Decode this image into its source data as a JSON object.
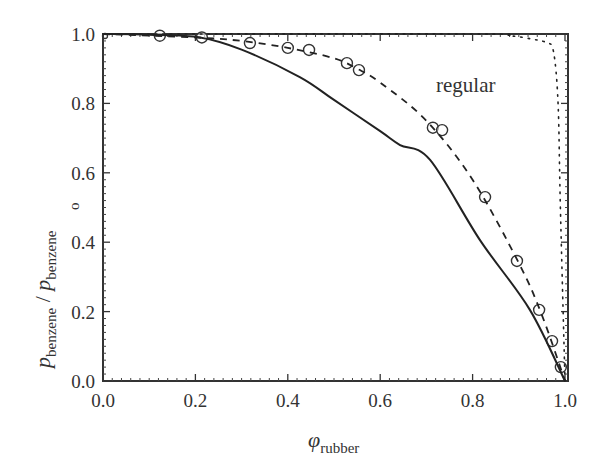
{
  "chart_data": {
    "type": "line",
    "title": "",
    "xlabel": "φ_rubber",
    "xlabel_symbol": "φ",
    "xlabel_sub": "rubber",
    "ylabel": "p_benzene / p°_benzene",
    "ylabel_parts": {
      "p1": "p",
      "sub1": "benzene",
      "slash": " / ",
      "p2": "p",
      "sup2": "o",
      "sub2": "benzene"
    },
    "xlim": [
      0.0,
      1.0
    ],
    "ylim": [
      0.0,
      1.0
    ],
    "xticks": [
      "0.0",
      "0.2",
      "0.4",
      "0.6",
      "0.8",
      "1.0"
    ],
    "yticks": [
      "0.0",
      "0.2",
      "0.4",
      "0.6",
      "0.8",
      "1.0"
    ],
    "grid": false,
    "legend": "none",
    "annotations": [
      {
        "text": "regular",
        "x": 0.74,
        "y": 0.84
      }
    ],
    "series": [
      {
        "name": "data (circles)",
        "style": "markers",
        "x": [
          0.0,
          0.123,
          0.214,
          0.318,
          0.4,
          0.446,
          0.528,
          0.554,
          0.714,
          0.734,
          0.827,
          0.896,
          0.944,
          0.972,
          0.991
        ],
        "y": [
          1.0,
          0.995,
          0.99,
          0.974,
          0.96,
          0.954,
          0.916,
          0.896,
          0.73,
          0.723,
          0.53,
          0.346,
          0.205,
          0.115,
          0.04
        ]
      },
      {
        "name": "dashed fit",
        "style": "dashed",
        "x": [
          0.0,
          0.2,
          0.3,
          0.4,
          0.5,
          0.55,
          0.6,
          0.7,
          0.8,
          0.9,
          0.95,
          1.0
        ],
        "y": [
          1.0,
          0.99,
          0.98,
          0.96,
          0.93,
          0.9,
          0.86,
          0.75,
          0.58,
          0.34,
          0.19,
          0.0
        ]
      },
      {
        "name": "solid",
        "style": "solid",
        "x": [
          0.0,
          0.1,
          0.21,
          0.3,
          0.426,
          0.5,
          0.6,
          0.643,
          0.708,
          0.816,
          0.924,
          1.0
        ],
        "y": [
          1.0,
          0.998,
          0.99,
          0.955,
          0.876,
          0.81,
          0.72,
          0.68,
          0.637,
          0.406,
          0.205,
          0.0
        ]
      },
      {
        "name": "regular",
        "style": "dotted",
        "x": [
          0.0,
          0.8,
          0.88,
          0.93,
          0.96,
          0.975,
          0.985,
          0.99,
          1.0
        ],
        "y": [
          1.0,
          1.0,
          0.995,
          0.985,
          0.975,
          0.95,
          0.8,
          0.5,
          0.0
        ]
      }
    ]
  }
}
